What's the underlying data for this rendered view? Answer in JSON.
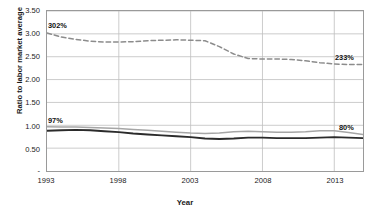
{
  "chart_data": {
    "type": "line",
    "title": "",
    "xlabel": "Year",
    "ylabel": "Ratio to labor market average",
    "xlim": [
      1993,
      2015
    ],
    "ylim": [
      0,
      3.5
    ],
    "grid": true,
    "legend": "none",
    "y_ticks": [
      "-",
      "0.50",
      "1.00",
      "1.50",
      "2.00",
      "2.50",
      "3.00",
      "3.50"
    ],
    "y_tick_values": [
      0,
      0.5,
      1.0,
      1.5,
      2.0,
      2.5,
      3.0,
      3.5
    ],
    "x_ticks": [
      "1993",
      "1998",
      "2003",
      "2008",
      "2013"
    ],
    "x_tick_values": [
      1993,
      1998,
      2003,
      2008,
      2013
    ],
    "x": [
      1993,
      1994,
      1995,
      1996,
      1997,
      1998,
      1999,
      2000,
      2001,
      2002,
      2003,
      2004,
      2005,
      2006,
      2007,
      2008,
      2009,
      2010,
      2011,
      2012,
      2013,
      2014,
      2015
    ],
    "series": [
      {
        "name": "top-ratio",
        "style": "dashed",
        "color": "#8c8c8c",
        "start_label": "302%",
        "end_label": "233%",
        "values": [
          3.02,
          2.93,
          2.88,
          2.84,
          2.82,
          2.82,
          2.83,
          2.85,
          2.86,
          2.87,
          2.86,
          2.85,
          2.72,
          2.56,
          2.46,
          2.45,
          2.45,
          2.44,
          2.41,
          2.37,
          2.34,
          2.33,
          2.33
        ]
      },
      {
        "name": "middle-ratio",
        "style": "solid",
        "color": "#a6a6a6",
        "start_label": "97%",
        "end_label": "80%",
        "values": [
          0.97,
          0.96,
          0.96,
          0.95,
          0.94,
          0.93,
          0.91,
          0.89,
          0.87,
          0.85,
          0.83,
          0.82,
          0.83,
          0.86,
          0.87,
          0.86,
          0.85,
          0.85,
          0.86,
          0.88,
          0.88,
          0.84,
          0.8
        ]
      },
      {
        "name": "bottom-ratio",
        "style": "solid",
        "color": "#2b2b2b",
        "start_label": "",
        "end_label": "",
        "values": [
          0.88,
          0.89,
          0.9,
          0.89,
          0.87,
          0.85,
          0.82,
          0.8,
          0.78,
          0.76,
          0.74,
          0.71,
          0.7,
          0.71,
          0.73,
          0.73,
          0.72,
          0.72,
          0.72,
          0.73,
          0.74,
          0.73,
          0.72
        ]
      }
    ],
    "annotations": [
      {
        "text": "302%",
        "series": "top-ratio",
        "position": "start"
      },
      {
        "text": "233%",
        "series": "top-ratio",
        "position": "end"
      },
      {
        "text": "97%",
        "series": "middle-ratio",
        "position": "start"
      },
      {
        "text": "80%",
        "series": "middle-ratio",
        "position": "end"
      }
    ]
  }
}
